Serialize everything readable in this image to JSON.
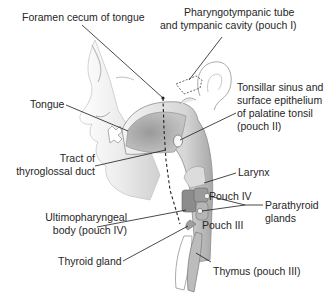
{
  "diagram": {
    "colors": {
      "background": "#ffffff",
      "line": "#1a1a1a",
      "tissue_light": "#e9e9e9",
      "tissue_mid": "#bdbdbd",
      "tissue_dark": "#8a8a8a",
      "text": "#262626"
    },
    "labels": {
      "foramen_cecum": "Foramen cecum of tongue",
      "pharyngotympanic_1": "Pharyngotympanic tube",
      "pharyngotympanic_2": "and tympanic cavity (pouch I)",
      "tongue": "Tongue",
      "tonsillar_1": "Tonsillar sinus and",
      "tonsillar_2": "surface epithelium",
      "tonsillar_3": "of palatine tonsil",
      "tonsillar_4": "(pouch II)",
      "thyroglossal_1": "Tract of",
      "thyroglossal_2": "thyroglossal duct",
      "larynx": "Larynx",
      "pouch_iv": "Pouch IV",
      "parathyroid_1": "Parathyroid",
      "parathyroid_2": "glands",
      "ultimopharyngeal_1": "Ultimopharyngeal",
      "ultimopharyngeal_2": "body (pouch IV)",
      "pouch_iii": "Pouch III",
      "thyroid": "Thyroid gland",
      "thymus": "Thymus (pouch III)"
    }
  }
}
